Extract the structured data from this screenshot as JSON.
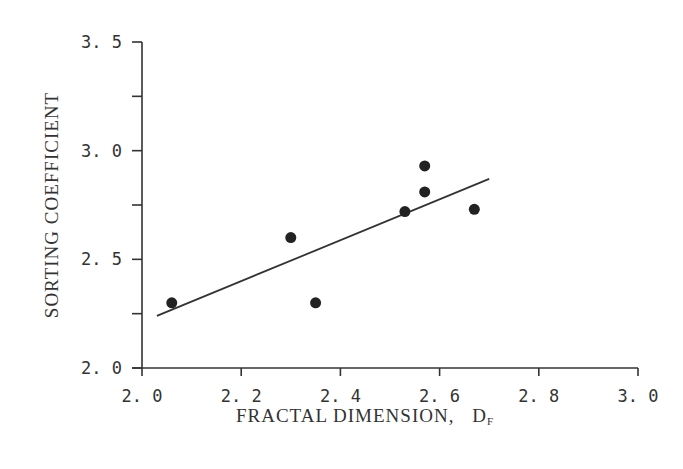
{
  "chart_data": {
    "type": "scatter",
    "title": "",
    "xlabel": "FRACTAL  DIMENSION,",
    "xlabel_symbol": "D",
    "xlabel_subscript": "F",
    "ylabel": "SORTING  COEFFICIENT",
    "xlim": [
      2.0,
      3.0
    ],
    "ylim": [
      2.0,
      3.5
    ],
    "xticks": [
      "2.0",
      "2.2",
      "2.4",
      "2.6",
      "2.8",
      "3.0"
    ],
    "yticks": [
      "2.0",
      "2.5",
      "3.0",
      "3.5"
    ],
    "grid": false,
    "legend": null,
    "points": [
      {
        "x": 2.06,
        "y": 2.3
      },
      {
        "x": 2.3,
        "y": 2.6
      },
      {
        "x": 2.35,
        "y": 2.3
      },
      {
        "x": 2.53,
        "y": 2.72
      },
      {
        "x": 2.57,
        "y": 2.81
      },
      {
        "x": 2.57,
        "y": 2.93
      },
      {
        "x": 2.67,
        "y": 2.73
      }
    ],
    "fit_line": {
      "x": [
        2.03,
        2.7
      ],
      "y": [
        2.24,
        2.87
      ]
    }
  }
}
